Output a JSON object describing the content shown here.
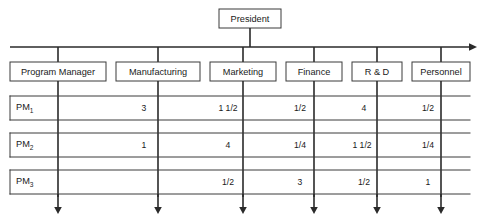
{
  "diagram": {
    "title_box": {
      "label": "President"
    },
    "departments": [
      {
        "id": "program-manager",
        "label": "Program Manager"
      },
      {
        "id": "manufacturing",
        "label": "Manufacturing"
      },
      {
        "id": "marketing",
        "label": "Marketing"
      },
      {
        "id": "finance",
        "label": "Finance"
      },
      {
        "id": "rd",
        "label": "R & D"
      },
      {
        "id": "personnel",
        "label": "Personnel"
      }
    ],
    "rows": [
      {
        "id": "pm1",
        "label_base": "PM",
        "label_sub": "1",
        "values": {
          "manufacturing": "3",
          "marketing": "1 1/2",
          "finance": "1/2",
          "rd": "4",
          "personnel": "1/2"
        }
      },
      {
        "id": "pm2",
        "label_base": "PM",
        "label_sub": "2",
        "values": {
          "manufacturing": "1",
          "marketing": "4",
          "finance": "1/4",
          "rd": "1 1/2",
          "personnel": "1/4"
        }
      },
      {
        "id": "pm3",
        "label_base": "PM",
        "label_sub": "3",
        "values": {
          "manufacturing": "",
          "marketing": "1/2",
          "finance": "3",
          "rd": "1/2",
          "personnel": "1"
        }
      }
    ],
    "colors": {
      "line": "#2a2a2a",
      "box_stroke": "#3a3a3a",
      "text": "#1a1a1a",
      "background": "#ffffff"
    }
  }
}
